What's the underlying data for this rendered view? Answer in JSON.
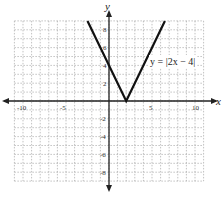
{
  "chart_data": {
    "type": "line",
    "title": "",
    "xlabel": "x",
    "ylabel": "y",
    "xlim": [
      -11,
      11
    ],
    "ylim": [
      -9,
      9
    ],
    "grid": true,
    "x_ticks": [
      -10,
      -5,
      5,
      10
    ],
    "y_ticks": [
      -8,
      -6,
      -4,
      -2,
      2,
      4,
      6,
      8
    ],
    "x_tick_labels": [
      "-10",
      "-5",
      "5",
      "10"
    ],
    "y_tick_labels": [
      "-8",
      "-6",
      "-4",
      "-2",
      "2",
      "4",
      "6",
      "8"
    ],
    "series": [
      {
        "name": "y = |2x - 4|",
        "x": [
          -2.5,
          2,
          6.5
        ],
        "y": [
          9,
          0,
          9
        ]
      }
    ],
    "annotations": [
      {
        "text": "y = |2x − 4|",
        "x": 6.5,
        "y": 4
      }
    ],
    "legend": "none"
  },
  "labels": {
    "x_axis": "x",
    "y_axis": "y",
    "equation": "y = |2x − 4|"
  }
}
